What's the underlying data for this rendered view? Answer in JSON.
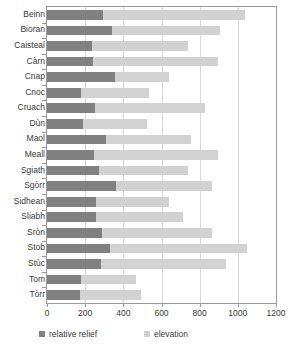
{
  "chart_data": {
    "type": "bar",
    "orientation": "horizontal",
    "stacked": true,
    "title": "",
    "xlabel": "",
    "ylabel": "",
    "xlim": [
      0,
      1200
    ],
    "xticks": [
      0,
      200,
      400,
      600,
      800,
      1000,
      1200
    ],
    "xtick_labels": [
      "0",
      "200",
      "400",
      "600",
      "800",
      "1000",
      "1200"
    ],
    "grid": true,
    "grid_axis": "x",
    "legend_position": "bottom",
    "categories": [
      "Beinn",
      "Bioran",
      "Caisteal",
      "Càrn",
      "Cnap",
      "Cnoc",
      "Cruach",
      "Dùn",
      "Maol",
      "Meall",
      "Sgiath",
      "Sgòrr",
      "Sidhean",
      "Sliabh",
      "Sròn",
      "Stob",
      "Stùc",
      "Tom",
      "Tòrr"
    ],
    "series": [
      {
        "name": "relative relief",
        "color": "#808080",
        "values": [
          295,
          340,
          235,
          240,
          355,
          180,
          250,
          190,
          310,
          245,
          275,
          360,
          255,
          255,
          290,
          330,
          285,
          180,
          175
        ]
      },
      {
        "name": "elevation",
        "color": "#d2d2d2",
        "values": [
          1040,
          905,
          740,
          895,
          640,
          535,
          830,
          525,
          755,
          895,
          740,
          865,
          640,
          715,
          865,
          1050,
          940,
          465,
          490
        ]
      }
    ]
  },
  "legend": {
    "relief_label": "relative relief",
    "elevation_label": "elevation"
  },
  "colors": {
    "relief": "#808080",
    "elevation": "#d2d2d2",
    "axis": "#9a9a9a",
    "grid": "#d9d9d9",
    "text": "#3a3a3a",
    "background": "#ffffff"
  }
}
